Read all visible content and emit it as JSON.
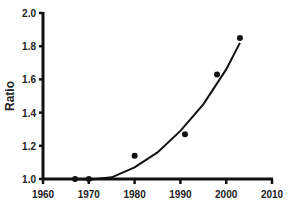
{
  "chart_data": {
    "type": "scatter",
    "title": "",
    "xlabel": "",
    "ylabel": "Ratio",
    "xlim": [
      1960,
      2010
    ],
    "ylim": [
      1.0,
      2.0
    ],
    "x_ticks": [
      "1960",
      "1970",
      "1980",
      "1990",
      "2000",
      "2010"
    ],
    "y_ticks": [
      "1.0",
      "1.2",
      "1.4",
      "1.6",
      "1.8",
      "2.0"
    ],
    "grid": false,
    "legend": null,
    "series": [
      {
        "name": "observed",
        "kind": "points",
        "x": [
          1967,
          1970,
          1980,
          1991,
          1998,
          2003
        ],
        "y": [
          1.0,
          1.0,
          1.14,
          1.27,
          1.63,
          1.85
        ]
      },
      {
        "name": "fit",
        "kind": "curve",
        "x": [
          1967,
          1970,
          1975,
          1980,
          1985,
          1990,
          1995,
          2000,
          2003
        ],
        "y": [
          1.0,
          0.995,
          1.01,
          1.07,
          1.16,
          1.29,
          1.45,
          1.66,
          1.82
        ]
      }
    ],
    "colors": {
      "axis": "#111111",
      "marker": "#111111",
      "curve": "#111111"
    }
  }
}
